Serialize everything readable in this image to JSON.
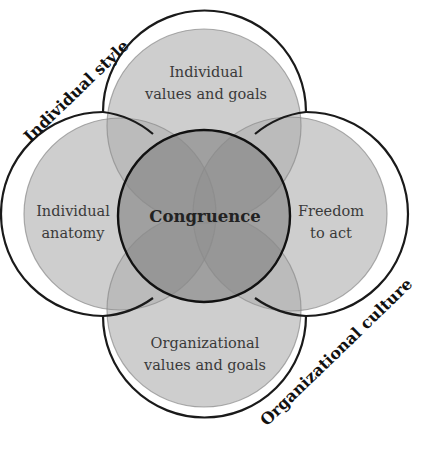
{
  "diagram": {
    "center": {
      "label": "Congruence"
    },
    "circles": {
      "top": {
        "line1": "Individual",
        "line2": "values and goals"
      },
      "left": {
        "line1": "Individual",
        "line2": "anatomy"
      },
      "right": {
        "line1": "Freedom",
        "line2": "to act"
      },
      "bottom": {
        "line1": "Organizational",
        "line2": "values and goals"
      }
    },
    "side_labels": {
      "upper_left": "Individual style",
      "lower_right": "Organizational culture"
    },
    "colors": {
      "outer_fill": "#c4c4c4",
      "center_fill": "#8e8e8e",
      "stroke": "#1a1a1a",
      "faint_stroke": "#9a9a9a"
    }
  }
}
